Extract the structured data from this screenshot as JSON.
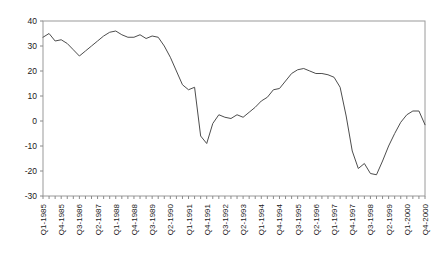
{
  "chart_data": {
    "type": "line",
    "title": "",
    "subtitle": "",
    "xlabel": "",
    "ylabel": "",
    "ylim": [
      -30,
      40
    ],
    "ytick_values": [
      -30,
      -20,
      -10,
      0,
      10,
      20,
      30,
      40
    ],
    "ytick_labels": [
      "-30",
      "-20",
      "-10",
      "0",
      "10",
      "20",
      "30",
      "40"
    ],
    "grid": false,
    "legend": "none",
    "xtick_labels": [
      "Q1-1985",
      "Q4-1985",
      "Q3-1986",
      "Q2-1987",
      "Q1-1988",
      "Q4-1988",
      "Q3-1989",
      "Q2-1990",
      "Q1-1991",
      "Q4-1991",
      "Q3-1992",
      "Q2-1993",
      "Q1-1994",
      "Q4-1994",
      "Q3-1995",
      "Q2-1996",
      "Q1-1997",
      "Q4-1997",
      "Q3-1998",
      "Q2-1999",
      "Q1-2000",
      "Q4-2000"
    ],
    "xtick_label_interval": 3,
    "x": [
      "Q1-1985",
      "Q2-1985",
      "Q3-1985",
      "Q4-1985",
      "Q1-1986",
      "Q2-1986",
      "Q3-1986",
      "Q4-1986",
      "Q1-1987",
      "Q2-1987",
      "Q3-1987",
      "Q4-1987",
      "Q1-1988",
      "Q2-1988",
      "Q3-1988",
      "Q4-1988",
      "Q1-1989",
      "Q2-1989",
      "Q3-1989",
      "Q4-1989",
      "Q1-1990",
      "Q2-1990",
      "Q3-1990",
      "Q4-1990",
      "Q1-1991",
      "Q2-1991",
      "Q3-1991",
      "Q4-1991",
      "Q1-1992",
      "Q2-1992",
      "Q3-1992",
      "Q4-1992",
      "Q1-1993",
      "Q2-1993",
      "Q3-1993",
      "Q4-1993",
      "Q1-1994",
      "Q2-1994",
      "Q3-1994",
      "Q4-1994",
      "Q1-1995",
      "Q2-1995",
      "Q3-1995",
      "Q4-1995",
      "Q1-1996",
      "Q2-1996",
      "Q3-1996",
      "Q4-1996",
      "Q1-1997",
      "Q2-1997",
      "Q3-1997",
      "Q4-1997",
      "Q1-1998",
      "Q2-1998",
      "Q3-1998",
      "Q4-1998",
      "Q1-1999",
      "Q2-1999",
      "Q3-1999",
      "Q4-1999",
      "Q1-2000",
      "Q2-2000",
      "Q3-2000",
      "Q4-2000"
    ],
    "series": [
      {
        "name": "series-1",
        "color": "#4d4d4d",
        "values": [
          33.5,
          35.0,
          32.0,
          32.5,
          31.0,
          28.5,
          26.0,
          28.0,
          30.0,
          32.0,
          34.0,
          35.5,
          36.0,
          34.5,
          33.5,
          33.5,
          34.5,
          33.0,
          34.0,
          33.5,
          30.0,
          25.5,
          20.0,
          14.5,
          12.5,
          13.5,
          -6.0,
          -9.0,
          -1.0,
          2.5,
          1.5,
          1.0,
          2.5,
          1.5,
          3.5,
          5.5,
          8.0,
          9.5,
          12.5,
          13.0,
          16.0,
          19.0,
          20.5,
          21.0,
          20.0,
          19.0,
          19.0,
          18.5,
          17.5,
          13.5,
          2.0,
          -12.0,
          -19.0,
          -17.0,
          -21.0,
          -21.5,
          -16.0,
          -10.0,
          -5.0,
          -0.5,
          2.5,
          4.0,
          4.0,
          -1.5
        ]
      }
    ]
  },
  "axis": {
    "x_axis_name": "x-axis",
    "y_axis_name": "y-axis"
  }
}
